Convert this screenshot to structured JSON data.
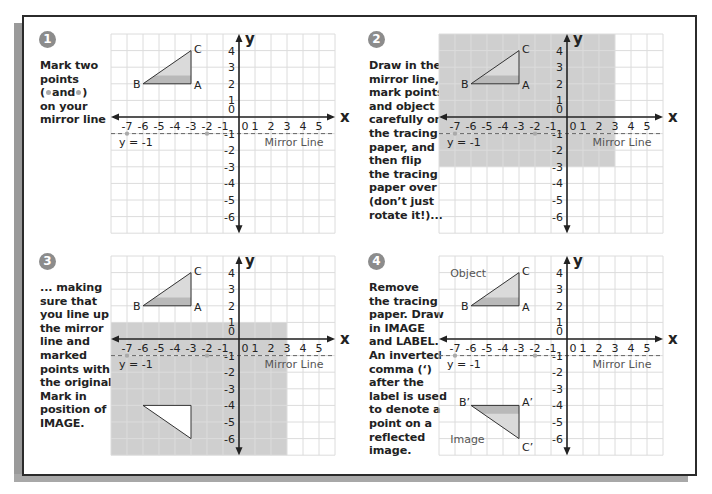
{
  "steps": [
    {
      "number": "1",
      "text": "Mark two\npoints\n( ● and ● )\non your\nmirror line",
      "text_parts": [
        "Mark two",
        "points",
        "(",
        "and",
        ")",
        "on your",
        "mirror line"
      ]
    },
    {
      "number": "2",
      "text": "Draw in the\nmirror line,\nmark points\nand object\ncarefully on\nthe tracing\npaper, and\nthen flip\nthe tracing\npaper over\n(don’t just\nrotate it!)..."
    },
    {
      "number": "3",
      "text": "... making\nsure that\nyou line up\nthe mirror\nline and\nmarked\npoints with\nthe original.\nMark in\nposition of\nIMAGE."
    },
    {
      "number": "4",
      "text": "Remove\nthe tracing\npaper. Draw\nin IMAGE\nand LABEL.\nAn inverted\ncomma (‘)\nafter the\nlabel is used\nto denote a\npoint on a\nreflected\nimage."
    }
  ],
  "chart_data": [
    {
      "type": "diagram",
      "panel": 1,
      "x_axis_label": "x",
      "y_axis_label": "y",
      "x_ticks": [
        -7,
        -6,
        -5,
        -4,
        -3,
        -2,
        -1,
        0,
        1,
        2,
        3,
        4,
        5
      ],
      "y_ticks": [
        4,
        3,
        2,
        1,
        0,
        -1,
        -2,
        -3,
        -4,
        -5,
        -6
      ],
      "xlim": [
        -8,
        6
      ],
      "ylim": [
        -7,
        5
      ],
      "mirror_line": {
        "equation": "y = -1",
        "label": "Mirror Line",
        "style": "dashed"
      },
      "marked_points": [
        [
          -7,
          -1
        ],
        [
          -2,
          -1
        ]
      ],
      "object": {
        "A": [
          -3,
          2
        ],
        "B": [
          -6,
          2
        ],
        "C": [
          -3,
          4
        ]
      },
      "tracing_paper": null,
      "image": null
    },
    {
      "type": "diagram",
      "panel": 2,
      "x_axis_label": "x",
      "y_axis_label": "y",
      "xlim": [
        -8,
        6
      ],
      "ylim": [
        -7,
        5
      ],
      "mirror_line": {
        "equation": "y = -1",
        "label": "Mirror Line",
        "style": "dashed"
      },
      "marked_points": [
        [
          -7,
          -1
        ],
        [
          -2,
          -1
        ]
      ],
      "object": {
        "A": [
          -3,
          2
        ],
        "B": [
          -6,
          2
        ],
        "C": [
          -3,
          4
        ]
      },
      "tracing_paper": {
        "x": [
          -8,
          3
        ],
        "y": [
          -3,
          5
        ]
      },
      "image": null
    },
    {
      "type": "diagram",
      "panel": 3,
      "x_axis_label": "x",
      "y_axis_label": "y",
      "xlim": [
        -8,
        6
      ],
      "ylim": [
        -7,
        5
      ],
      "mirror_line": {
        "equation": "y = -1",
        "label": "Mirror Line",
        "style": "dashed"
      },
      "marked_points": [
        [
          -7,
          -1
        ],
        [
          -2,
          -1
        ]
      ],
      "object": {
        "A": [
          -3,
          2
        ],
        "B": [
          -6,
          2
        ],
        "C": [
          -3,
          4
        ]
      },
      "tracing_paper": {
        "x": [
          -8,
          3
        ],
        "y": [
          -7,
          1
        ]
      },
      "image": {
        "outline_only": true,
        "A'": [
          -3,
          -4
        ],
        "B'": [
          -6,
          -4
        ],
        "C'": [
          -3,
          -6
        ]
      }
    },
    {
      "type": "diagram",
      "panel": 4,
      "x_axis_label": "x",
      "y_axis_label": "y",
      "xlim": [
        -8,
        6
      ],
      "ylim": [
        -7,
        5
      ],
      "mirror_line": {
        "equation": "y = -1",
        "label": "Mirror Line",
        "style": "dashed"
      },
      "marked_points": [
        [
          -7,
          -1
        ],
        [
          -2,
          -1
        ]
      ],
      "object": {
        "label": "Object",
        "A": [
          -3,
          2
        ],
        "B": [
          -6,
          2
        ],
        "C": [
          -3,
          4
        ]
      },
      "tracing_paper": null,
      "image": {
        "label": "Image",
        "A'": [
          -3,
          -4
        ],
        "B'": [
          -6,
          -4
        ],
        "C'": [
          -3,
          -6
        ]
      }
    }
  ],
  "labels": {
    "x_axis": "x",
    "y_axis": "y",
    "mirror_equation": "y = -1",
    "mirror_line": "Mirror Line",
    "object": "Object",
    "image": "Image",
    "A": "A",
    "B": "B",
    "C": "C",
    "A_prime": "A’",
    "B_prime": "B’",
    "C_prime": "C’"
  },
  "colors": {
    "frame": "#2b2b2b",
    "badge": "#8c8c8c",
    "grid": "#dcdcdc",
    "tracing_paper": "#cfcfcf",
    "triangle_light": "#dadada",
    "triangle_dark": "#b9b9b9",
    "dot": "#aaaaaa"
  }
}
